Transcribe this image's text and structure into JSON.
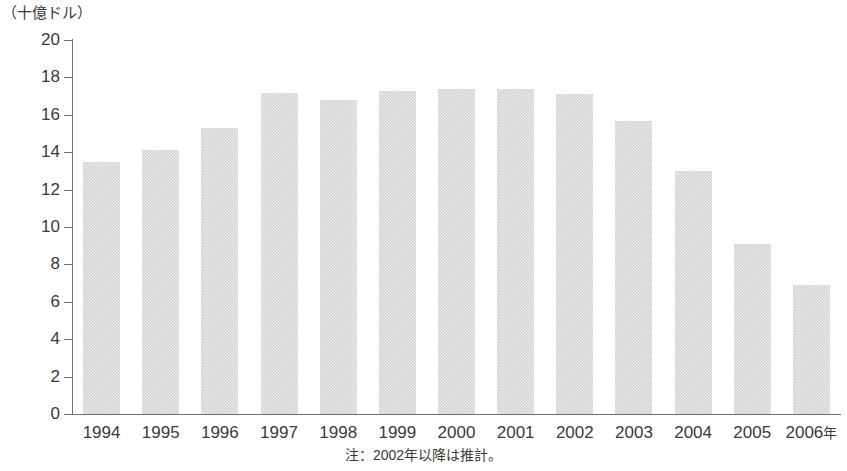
{
  "chart_data": {
    "type": "bar",
    "title": "",
    "subtitle": "",
    "xlabel": "",
    "ylabel": "（十億ドル）",
    "unit_label": "（十億ドル）",
    "categories": [
      "1994",
      "1995",
      "1996",
      "1997",
      "1998",
      "1999",
      "2000",
      "2001",
      "2002",
      "2003",
      "2004",
      "2005",
      "2006"
    ],
    "category_labels": [
      "1994",
      "1995",
      "1996",
      "1997",
      "1998",
      "1999",
      "2000",
      "2001",
      "2002",
      "2003",
      "2004",
      "2005",
      "2006年"
    ],
    "values": [
      13.5,
      14.1,
      15.3,
      17.15,
      16.8,
      17.3,
      17.4,
      17.4,
      17.1,
      15.65,
      13.0,
      9.1,
      6.9
    ],
    "ylim": [
      0,
      20
    ],
    "ytick_labels": [
      "20",
      "18",
      "16",
      "14",
      "12",
      "10",
      "8",
      "6",
      "4",
      "2",
      "0"
    ],
    "yticks": [
      20,
      18,
      16,
      14,
      12,
      10,
      8,
      6,
      4,
      2,
      0
    ],
    "grid": false,
    "legend": null,
    "legend_position": "none",
    "bar_color": "#d4d4d4",
    "axis_color": "#6f6f6f",
    "text_color": "#3a3a3a",
    "annotations": [
      {
        "name": "footnote",
        "text": "注：2002年以降は推計。"
      }
    ]
  },
  "footnote": "注：2002年以降は推計。",
  "x_axis_suffix": "年"
}
